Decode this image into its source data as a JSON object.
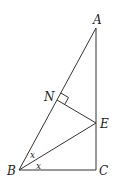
{
  "diagram": {
    "type": "geometry",
    "points": {
      "A": {
        "label": "A",
        "x": 96,
        "y": 28
      },
      "B": {
        "label": "B",
        "x": 19,
        "y": 170
      },
      "C": {
        "label": "C",
        "x": 96,
        "y": 170
      },
      "E": {
        "label": "E",
        "x": 96,
        "y": 123
      },
      "N": {
        "label": "N",
        "x": 57,
        "y": 100
      }
    },
    "segments": [
      "AB",
      "AC",
      "BC",
      "BE",
      "NE"
    ],
    "right_angle_at": "N",
    "angle_labels": [
      {
        "label": "x",
        "x": 30,
        "y": 158
      },
      {
        "label": "x",
        "x": 36,
        "y": 169
      }
    ]
  }
}
